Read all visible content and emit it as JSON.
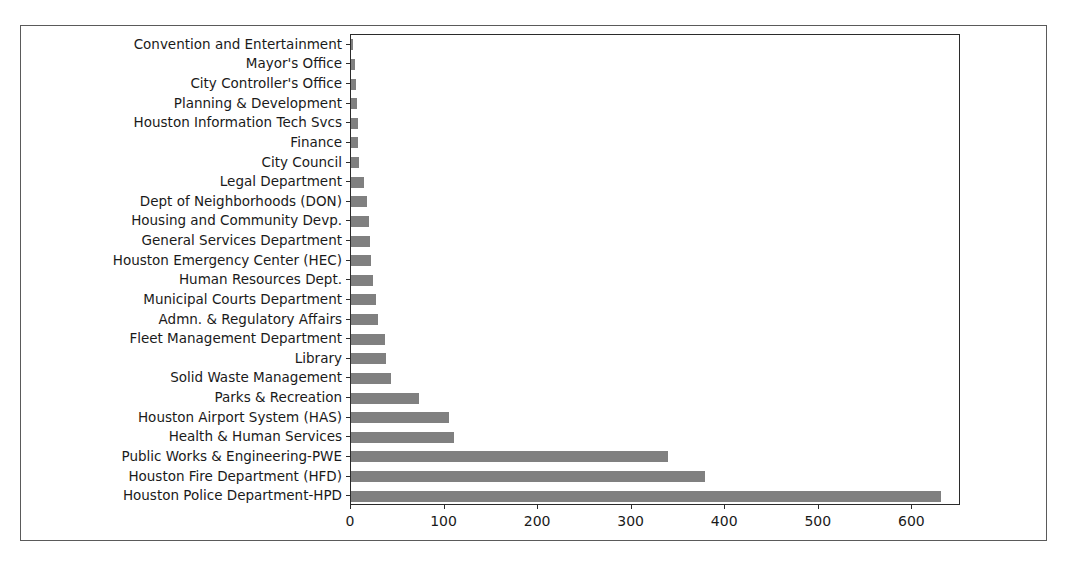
{
  "chart_data": {
    "type": "bar",
    "orientation": "horizontal",
    "title": "",
    "xlabel": "",
    "ylabel": "",
    "xlim": [
      0,
      652
    ],
    "xticks": [
      0,
      100,
      200,
      300,
      400,
      500,
      600
    ],
    "xticklabels": [
      "0",
      "100",
      "200",
      "300",
      "400",
      "500",
      "600"
    ],
    "grid": false,
    "legend": false,
    "bar_color": "#808080",
    "categories": [
      "Convention and Entertainment",
      "Mayor's Office",
      "City Controller's Office",
      "Planning & Development",
      "Houston Information Tech Svcs",
      "Finance",
      "City Council",
      "Legal Department",
      "Dept of Neighborhoods (DON)",
      "Housing and Community Devp.",
      "General Services Department",
      "Houston Emergency Center (HEC)",
      "Human Resources Dept.",
      "Municipal Courts Department",
      "Admn. & Regulatory Affairs",
      "Fleet Management Department",
      "Library",
      "Solid Waste Management",
      "Parks & Recreation",
      "Houston Airport System (HAS)",
      "Health & Human Services",
      "Public Works & Engineering-PWE",
      "Houston Fire Department (HFD)",
      "Houston Police Department-HPD"
    ],
    "values": [
      1,
      4,
      5,
      6,
      7,
      8,
      9,
      14,
      17,
      19,
      20,
      21,
      23,
      27,
      29,
      36,
      37,
      43,
      73,
      105,
      110,
      339,
      378,
      631
    ]
  }
}
